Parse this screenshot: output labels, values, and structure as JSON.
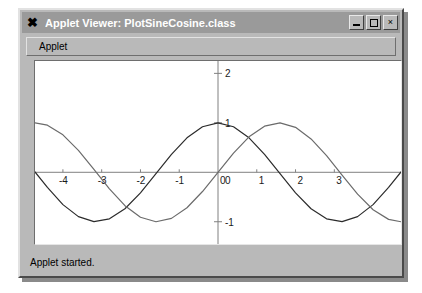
{
  "window": {
    "title": "Applet Viewer: PlotSineCosine.class",
    "app_icon": "x-logo-icon",
    "buttons": {
      "minimize": "_",
      "maximize": "□",
      "close": "×"
    }
  },
  "menubar": {
    "items": [
      {
        "label": "Applet"
      }
    ]
  },
  "statusbar": {
    "text": "Applet started."
  },
  "colors": {
    "titlebar": "#9a9a9a",
    "window_face": "#b9b9b9",
    "plot_background": "#ffffff",
    "axis": "#808080",
    "cosine_curve": "#2b2b2b",
    "sine_curve": "#6b6b6b"
  },
  "chart_data": {
    "type": "line",
    "title": "",
    "xlabel": "",
    "ylabel": "",
    "xlim": [
      -4.72,
      4.72
    ],
    "ylim": [
      -1.45,
      2.25
    ],
    "grid": false,
    "legend": "none",
    "xticks": [
      -4,
      -3,
      -2,
      -1,
      0,
      1,
      2,
      3
    ],
    "xticklabels": [
      "-4",
      "-3",
      "-2",
      "-1",
      "0",
      "1",
      "2",
      "3"
    ],
    "yticks": [
      -1,
      0,
      1,
      2
    ],
    "yticklabels": [
      "-1",
      "0",
      "1",
      "2"
    ],
    "series": [
      {
        "name": "cos(x)",
        "color": "#2b2b2b",
        "x": [
          -4.72,
          -4.4,
          -4.0,
          -3.6,
          -3.2,
          -2.8,
          -2.4,
          -2.0,
          -1.6,
          -1.2,
          -0.8,
          -0.4,
          0.0,
          0.4,
          0.8,
          1.2,
          1.6,
          2.0,
          2.4,
          2.8,
          3.2,
          3.6,
          4.0,
          4.4,
          4.72
        ],
        "y": [
          0.006,
          -0.307,
          -0.654,
          -0.897,
          -0.998,
          -0.942,
          -0.737,
          -0.416,
          -0.029,
          0.362,
          0.697,
          0.921,
          1.0,
          0.921,
          0.697,
          0.362,
          -0.029,
          -0.416,
          -0.737,
          -0.942,
          -0.998,
          -0.897,
          -0.654,
          -0.307,
          0.006
        ]
      },
      {
        "name": "sin(x)",
        "color": "#6b6b6b",
        "x": [
          -4.72,
          -4.4,
          -4.0,
          -3.6,
          -3.2,
          -2.8,
          -2.4,
          -2.0,
          -1.6,
          -1.2,
          -0.8,
          -0.4,
          0.0,
          0.4,
          0.8,
          1.2,
          1.6,
          2.0,
          2.4,
          2.8,
          3.2,
          3.6,
          4.0,
          4.4,
          4.72
        ],
        "y": [
          1.0,
          0.952,
          0.757,
          0.443,
          0.058,
          -0.335,
          -0.675,
          -0.909,
          -1.0,
          -0.932,
          -0.717,
          -0.389,
          0.0,
          0.389,
          0.717,
          0.932,
          1.0,
          0.909,
          0.675,
          0.335,
          -0.058,
          -0.443,
          -0.757,
          -0.952,
          -1.0
        ]
      }
    ]
  }
}
